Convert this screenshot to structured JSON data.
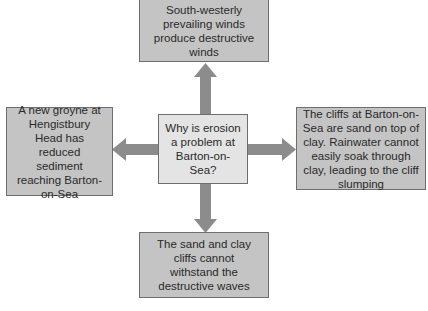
{
  "diagram": {
    "type": "spider-diagram",
    "colors": {
      "outer_box_fill": "#c4c4c4",
      "center_box_fill": "#e4e4e4",
      "border": "#6e6e6e",
      "arrow": "#8c8c8c",
      "text": "#2a2a2a"
    },
    "center": {
      "text": "Why is erosion a problem at Barton-on-Sea?"
    },
    "nodes": {
      "top": {
        "text": "South-westerly prevailing winds produce destructive winds"
      },
      "left": {
        "text": "A new groyne at Hengistbury Head has reduced sediment reaching Barton-on-Sea"
      },
      "right": {
        "text": "The cliffs at Barton-on-Sea are sand on top of clay. Rainwater cannot easily soak through clay, leading to the cliff slumping"
      },
      "bottom": {
        "text": "The sand and clay cliffs cannot withstand the destructive waves"
      }
    }
  }
}
